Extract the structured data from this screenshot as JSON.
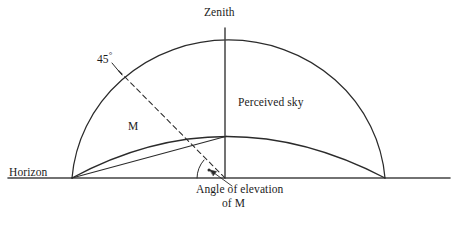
{
  "diagram": {
    "background_color": "#ffffff",
    "line_color": "#2b2b2b",
    "text_color": "#1b1b1b",
    "labels": {
      "zenith": "Zenith",
      "angle_45": "45",
      "degree_symbol": "°",
      "perceived_sky": "Perceived sky",
      "point_m": "M",
      "horizon": "Horizon",
      "angle_of_elevation_line1": "Angle of elevation",
      "angle_of_elevation_line2": "of M"
    },
    "geometry": {
      "horizon_y": 178,
      "horizon_x_start": 8,
      "horizon_x_end": 450,
      "left_base": [
        72,
        178
      ],
      "right_base": [
        385,
        178
      ],
      "center": [
        225,
        178
      ],
      "zenith_point": [
        225,
        28
      ],
      "outer_dome_apex_y": 28,
      "perceived_sky_apex_y": 115,
      "point_m": [
        145,
        136
      ],
      "dashed_ray_end": [
        117,
        69
      ],
      "angle_arc_radius": 28,
      "angle_degrees": 45
    }
  }
}
